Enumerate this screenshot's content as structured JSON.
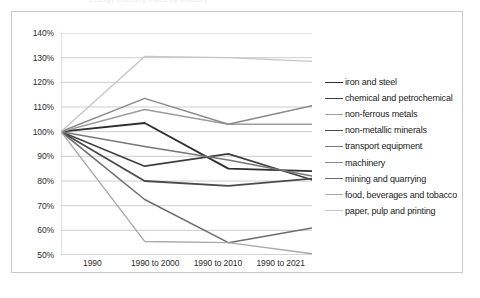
{
  "figure": {
    "background_color": "#ffffff",
    "frame_color": "#c9c9c9",
    "title_remnant": "Energy intensity index by industry"
  },
  "chart_data": {
    "type": "line",
    "title": "",
    "xlabel": "",
    "ylabel": "",
    "categories": [
      "1990",
      "1990 to 2000",
      "1990 to 2010",
      "1990 to 2021"
    ],
    "ylim": [
      50,
      140
    ],
    "yticks": [
      "50%",
      "60%",
      "70%",
      "80%",
      "90%",
      "100%",
      "110%",
      "120%",
      "130%",
      "140%"
    ],
    "ytick_values": [
      50,
      60,
      70,
      80,
      90,
      100,
      110,
      120,
      130,
      140
    ],
    "grid": true,
    "legend_position": "right",
    "series": [
      {
        "name": "iron and steel",
        "color": "#2f2f2f",
        "width": 1.9,
        "values": [
          100,
          103.5,
          85.0,
          84.0
        ]
      },
      {
        "name": "chemical and petrochemical",
        "color": "#3f3f3f",
        "width": 1.7,
        "values": [
          100,
          86.0,
          91.0,
          80.5
        ]
      },
      {
        "name": "non-ferrous metals",
        "color": "#9c9c9c",
        "width": 1.5,
        "values": [
          100,
          109.0,
          103.0,
          103.0
        ]
      },
      {
        "name": "non-metallic minerals",
        "color": "#4a4a4a",
        "width": 1.8,
        "values": [
          100,
          80.0,
          78.0,
          81.0
        ]
      },
      {
        "name": "transport equipment",
        "color": "#777777",
        "width": 1.5,
        "values": [
          100,
          94.0,
          88.5,
          82.0
        ]
      },
      {
        "name": "machinery",
        "color": "#8a8a8a",
        "width": 1.5,
        "values": [
          100,
          113.5,
          103.0,
          110.5
        ]
      },
      {
        "name": "mining and quarrying",
        "color": "#6d6d6d",
        "width": 1.5,
        "values": [
          100,
          72.5,
          55.0,
          61.0
        ]
      },
      {
        "name": "food, beverages and tobacco",
        "color": "#a8a8a8",
        "width": 1.4,
        "values": [
          100,
          55.5,
          55.0,
          50.5
        ]
      },
      {
        "name": "paper, pulp and printing",
        "color": "#c6c6c6",
        "width": 1.4,
        "values": [
          100,
          130.5,
          130.0,
          128.5
        ]
      }
    ]
  }
}
